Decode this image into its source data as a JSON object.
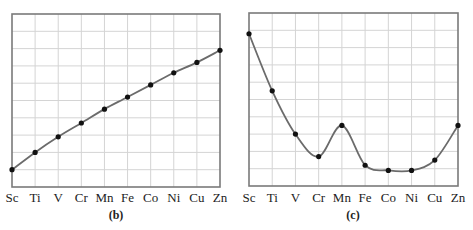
{
  "chart_data": [
    {
      "id": "b",
      "type": "line",
      "title": "",
      "caption": "(b)",
      "xlabel": "",
      "ylabel": "",
      "categories": [
        "Sc",
        "Ti",
        "V",
        "Cr",
        "Mn",
        "Fe",
        "Co",
        "Ni",
        "Cu",
        "Zn"
      ],
      "values": [
        1.0,
        2.0,
        2.9,
        3.7,
        4.5,
        5.2,
        5.9,
        6.6,
        7.2,
        7.9
      ],
      "ylim": [
        0,
        10
      ],
      "y_units": "relative grid units (no numeric scale shown)",
      "grid": true,
      "markers": true,
      "legend": null
    },
    {
      "id": "c",
      "type": "line",
      "title": "",
      "caption": "(c)",
      "xlabel": "",
      "ylabel": "",
      "categories": [
        "Sc",
        "Ti",
        "V",
        "Cr",
        "Mn",
        "Fe",
        "Co",
        "Ni",
        "Cu",
        "Zn"
      ],
      "values": [
        8.8,
        5.5,
        3.0,
        1.7,
        3.5,
        1.2,
        0.9,
        0.9,
        1.5,
        3.5
      ],
      "ylim": [
        0,
        10
      ],
      "y_units": "relative grid units (no numeric scale shown)",
      "grid": true,
      "markers": true,
      "legend": null
    }
  ],
  "style": {
    "line_color": "#6b6b6b",
    "marker_color": "#111111",
    "grid_color": "#d4d4d4",
    "frame_color": "#7a7a7a"
  }
}
